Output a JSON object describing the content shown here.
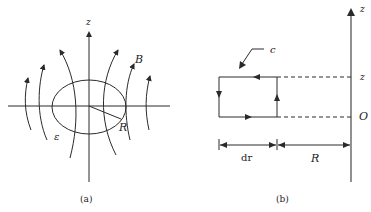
{
  "figure_a": {
    "caption": "(a)",
    "labels": {
      "z_axis": "z",
      "field": "B",
      "radius": "R",
      "emf": "ε"
    },
    "elements": [
      "z-axis",
      "horizontal-axis",
      "loop-ellipse",
      "radius-line",
      "field-lines"
    ],
    "field_line_count": 6
  },
  "figure_b": {
    "caption": "(b)",
    "labels": {
      "z_axis_top": "z",
      "z_level": "z",
      "origin": "O",
      "contour": "c",
      "width": "dr",
      "distance": "R"
    },
    "elements": [
      "z-axis",
      "rectangular-contour",
      "dashed-guides",
      "dimension-arrows",
      "pointer-arrow"
    ]
  },
  "colors": {
    "stroke": "#2a2a2a",
    "axis_b": "#555555",
    "background": "#ffffff"
  }
}
